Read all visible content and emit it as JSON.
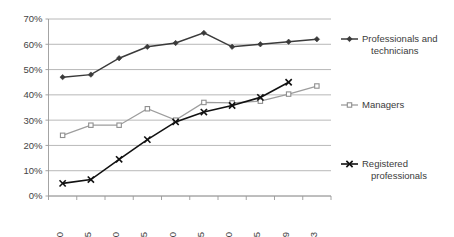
{
  "chart_data": {
    "type": "line",
    "title": "",
    "subtitle": "",
    "xlabel": "",
    "ylabel": "",
    "categories": [
      "1970",
      "1975",
      "1980",
      "1985",
      "1990",
      "1995",
      "2000",
      "2005",
      "2009",
      "2013"
    ],
    "ylim": [
      0,
      70
    ],
    "ytick_labels": [
      "0%",
      "10%",
      "20%",
      "30%",
      "40%",
      "50%",
      "60%",
      "70%"
    ],
    "ytick_values": [
      0,
      10,
      20,
      30,
      40,
      50,
      60,
      70
    ],
    "grid": "horizontal",
    "legend_position": "right",
    "value_suffix": "%",
    "series": [
      {
        "name": "Professionals and technicians",
        "legend_label_line1": "Professionals and",
        "legend_label_line2": "technicians",
        "marker": "diamond",
        "color": "#3a3a3a",
        "values": [
          47,
          48,
          54.5,
          59,
          60.5,
          64.5,
          59,
          60,
          61,
          62
        ]
      },
      {
        "name": "Managers",
        "legend_label_line1": "Managers",
        "legend_label_line2": "",
        "marker": "square-open",
        "color": "#9d9d9d",
        "values": [
          24,
          28,
          28,
          34.5,
          30,
          37,
          36.8,
          37.5,
          40.3,
          43.5
        ]
      },
      {
        "name": "Registered professionals",
        "legend_label_line1": "Registered",
        "legend_label_line2": "professionals",
        "marker": "x",
        "color": "#111111",
        "values": [
          5,
          6.5,
          14.5,
          22.3,
          29.3,
          33.2,
          35.8,
          39,
          45,
          null
        ]
      }
    ]
  },
  "colors": {
    "background": "#ffffff",
    "gridline": "#a6a6a6",
    "axis": "#9a9a9a",
    "text": "#3b3b3b",
    "series_dark": "#3a3a3a",
    "series_gray": "#9d9d9d",
    "series_black": "#111111"
  }
}
